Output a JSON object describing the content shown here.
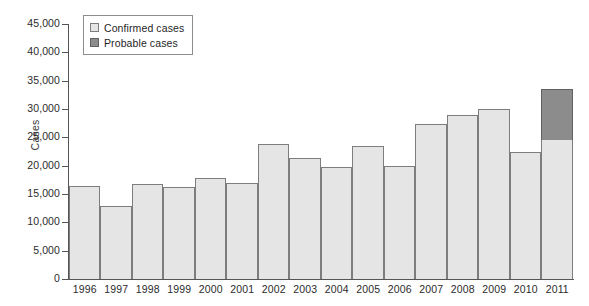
{
  "chart_data": {
    "type": "bar",
    "title": "",
    "subtitle": "",
    "xlabel": "",
    "ylabel": "Cases",
    "stacked": true,
    "grid": false,
    "legend_position": "top-left",
    "ylim": [
      0,
      45000
    ],
    "ytick_step": 5000,
    "yticks": [
      0,
      5000,
      10000,
      15000,
      20000,
      25000,
      30000,
      35000,
      40000,
      45000
    ],
    "ytick_labels": [
      "0",
      "5,000",
      "10,000",
      "15,000",
      "20,000",
      "25,000",
      "30,000",
      "35,000",
      "40,000",
      "45,000"
    ],
    "categories": [
      "1996",
      "1997",
      "1998",
      "1999",
      "2000",
      "2001",
      "2002",
      "2003",
      "2004",
      "2005",
      "2006",
      "2007",
      "2008",
      "2009",
      "2010",
      "2011"
    ],
    "series": [
      {
        "name": "Confirmed cases",
        "color": "#e5e5e5",
        "values": [
          16500,
          12900,
          16800,
          16300,
          17800,
          17000,
          23800,
          21300,
          19800,
          23400,
          19900,
          27400,
          29000,
          30000,
          22500,
          24500
        ]
      },
      {
        "name": "Probable cases",
        "color": "#8c8c8c",
        "values": [
          0,
          0,
          0,
          0,
          0,
          0,
          0,
          0,
          0,
          0,
          0,
          0,
          0,
          0,
          0,
          9000
        ]
      }
    ],
    "totals": [
      16500,
      12900,
      16800,
      16300,
      17800,
      17000,
      23800,
      21300,
      19800,
      23400,
      19900,
      27400,
      29000,
      30000,
      22500,
      33500
    ]
  },
  "legend": {
    "items": [
      {
        "label": "Confirmed cases",
        "color": "#e5e5e5"
      },
      {
        "label": "Probable cases",
        "color": "#8c8c8c"
      }
    ]
  },
  "axes": {
    "y_title": "Cases"
  },
  "colors": {
    "confirmed": "#e5e5e5",
    "probable": "#8c8c8c",
    "axis": "#555555",
    "bar_outline": "#7d7d7d",
    "background": "#ffffff"
  }
}
